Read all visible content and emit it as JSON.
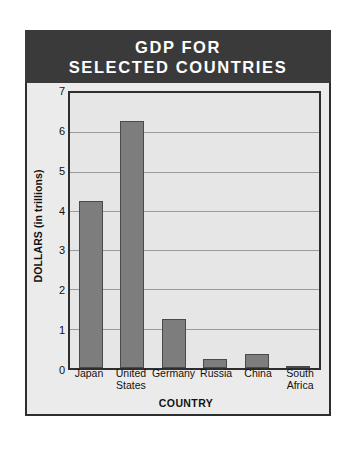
{
  "figure": {
    "title_lines": [
      "GDP FOR",
      "SELECTED COUNTRIES"
    ]
  },
  "chart_data": {
    "type": "bar",
    "title": "GDP FOR SELECTED COUNTRIES",
    "xlabel": "COUNTRY",
    "ylabel": "DOLLARS (in trillions)",
    "categories": [
      "Japan",
      "United States",
      "Germany",
      "Russia",
      "China",
      "South Africa"
    ],
    "category_lines": [
      [
        "Japan"
      ],
      [
        "United",
        "States"
      ],
      [
        "Germany"
      ],
      [
        "Russia"
      ],
      [
        "China"
      ],
      [
        "South",
        "Africa"
      ]
    ],
    "values": [
      4.25,
      6.3,
      1.25,
      0.22,
      0.35,
      0.05
    ],
    "ylim": [
      0,
      7
    ],
    "yticks": [
      0,
      1,
      2,
      3,
      4,
      5,
      6,
      7
    ],
    "ytick_labels": [
      "0",
      "1",
      "2",
      "3",
      "4",
      "5",
      "6",
      "7"
    ],
    "grid": true,
    "legend": false,
    "bar_color": "#7d7d7d",
    "bar_edge_color": "#4a4a4a",
    "plot_background": "#e6e6e6",
    "panel_background": "#ebebeb",
    "banner_color": "#3a3a3a",
    "banner_text_color": "#ffffff",
    "gridline_color": "#9a9a9a",
    "axis_color": "#2e2e2e"
  }
}
